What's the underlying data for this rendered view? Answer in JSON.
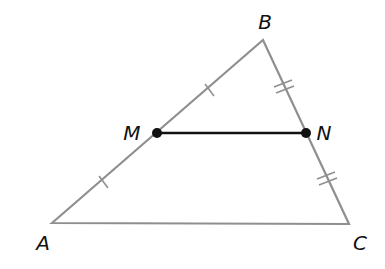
{
  "diagram": {
    "type": "triangle-midsegment",
    "colors": {
      "triangle": "#8f8f8f",
      "segment": "#111111",
      "points": "#111111"
    },
    "vertices": {
      "A": {
        "label": "A",
        "x": 52,
        "y": 223,
        "label_x": 43,
        "label_y": 243
      },
      "B": {
        "label": "B",
        "x": 263,
        "y": 40,
        "label_x": 265,
        "label_y": 22
      },
      "C": {
        "label": "C",
        "x": 349,
        "y": 224,
        "label_x": 360,
        "label_y": 243
      }
    },
    "points": {
      "M": {
        "label": "M",
        "x": 157,
        "y": 133,
        "label_x": 132,
        "label_y": 133
      },
      "N": {
        "label": "N",
        "x": 306,
        "y": 133,
        "label_x": 324,
        "label_y": 133
      }
    },
    "tick_marks": [
      {
        "side": "AM",
        "count": 1
      },
      {
        "side": "MB",
        "count": 1
      },
      {
        "side": "BN",
        "count": 2
      },
      {
        "side": "NC",
        "count": 2
      }
    ]
  }
}
